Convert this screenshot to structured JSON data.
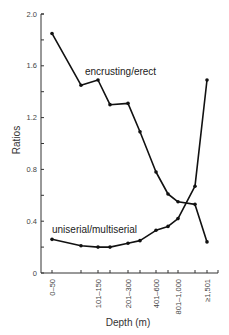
{
  "chart_data": {
    "type": "line",
    "title": "",
    "xlabel": "Depth (m)",
    "ylabel": "Ratios",
    "ylim": [
      0,
      2.0
    ],
    "yticks": [
      "0",
      "0.4",
      "0.8",
      "1.2",
      "1.6",
      "2.0"
    ],
    "x_tick_labels": [
      "0–50",
      "101–150",
      "201–300",
      "401–600",
      "801–1,000",
      "≥1,501"
    ],
    "categories": [
      "0–50",
      "51–100",
      "101–150",
      "151–200",
      "201–300",
      "301–400",
      "401–600",
      "601–800",
      "801–1,000",
      "1,001–1,500",
      "≥1,501"
    ],
    "series": [
      {
        "name": "encrusting/erect",
        "values": [
          1.85,
          1.45,
          1.49,
          1.3,
          1.31,
          1.09,
          0.78,
          0.61,
          0.55,
          0.53,
          0.24
        ]
      },
      {
        "name": "uniserial/multiserial",
        "values": [
          0.26,
          0.21,
          0.2,
          0.2,
          0.23,
          0.25,
          0.33,
          0.36,
          0.42,
          0.67,
          1.49
        ]
      }
    ],
    "grid": false,
    "legend": "inline labels"
  }
}
